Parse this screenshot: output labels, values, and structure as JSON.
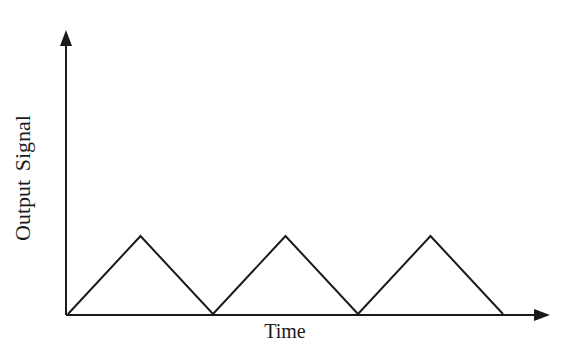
{
  "chart_data": {
    "type": "line",
    "title": "",
    "xlabel": "Time",
    "ylabel": "Output Signal",
    "grid": false,
    "legend": null,
    "x_ticks": [],
    "y_ticks": [],
    "series": [
      {
        "name": "Triangular waveform",
        "x": [
          0,
          1,
          2,
          3,
          4,
          5,
          6
        ],
        "y": [
          0,
          1,
          0,
          1,
          0,
          1,
          0
        ]
      }
    ],
    "xlim": [
      0,
      6.6
    ],
    "ylim": [
      0,
      3.6
    ],
    "style": {
      "line_color": "#1a1a1a",
      "axis_color": "#1a1a1a"
    }
  },
  "labels": {
    "x_axis": "Time",
    "y_axis": "Output Signal"
  }
}
